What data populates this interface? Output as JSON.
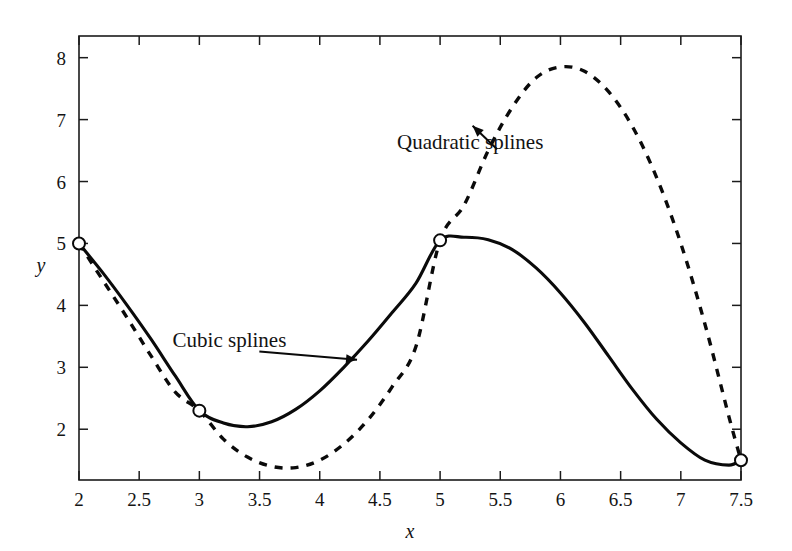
{
  "chart_data": {
    "type": "line",
    "title": "",
    "xlabel": "x",
    "ylabel": "y",
    "xlim": [
      2,
      7.5
    ],
    "ylim": [
      1.18,
      8.35
    ],
    "grid": false,
    "legend": "none",
    "x_ticks": [
      "2",
      "2.5",
      "3",
      "3.5",
      "4",
      "4.5",
      "5",
      "5.5",
      "6",
      "6.5",
      "7",
      "7.5"
    ],
    "x_tick_values": [
      2,
      2.5,
      3,
      3.5,
      4,
      4.5,
      5,
      5.5,
      6,
      6.5,
      7,
      7.5
    ],
    "y_ticks": [
      "8",
      "7",
      "6",
      "5",
      "4",
      "3",
      "2"
    ],
    "y_tick_values": [
      8,
      7,
      6,
      5,
      4,
      3,
      2
    ],
    "data_points": {
      "label": "interpolation knots",
      "marker": "open-circle",
      "x": [
        2,
        3,
        5,
        7.5
      ],
      "y": [
        5.0,
        2.3,
        5.05,
        1.5
      ]
    },
    "series": [
      {
        "name": "Cubic splines",
        "style": "solid",
        "color": "#0a0a0a",
        "x": [
          2.0,
          2.2,
          2.4,
          2.6,
          2.8,
          3.0,
          3.2,
          3.4,
          3.6,
          3.8,
          4.0,
          4.2,
          4.4,
          4.6,
          4.8,
          5.0,
          5.2,
          5.4,
          5.6,
          5.8,
          6.0,
          6.2,
          6.4,
          6.6,
          6.8,
          7.0,
          7.2,
          7.4,
          7.5
        ],
        "values": [
          5.0,
          4.52,
          4.0,
          3.45,
          2.86,
          2.3,
          2.1,
          2.04,
          2.12,
          2.32,
          2.62,
          3.0,
          3.42,
          3.88,
          4.36,
          5.05,
          5.1,
          5.06,
          4.9,
          4.6,
          4.2,
          3.72,
          3.18,
          2.64,
          2.16,
          1.78,
          1.5,
          1.42,
          1.5
        ]
      },
      {
        "name": "Quadratic splines",
        "style": "dashed",
        "color": "#0a0a0a",
        "x": [
          2.0,
          2.2,
          2.4,
          2.6,
          2.8,
          3.0,
          3.2,
          3.4,
          3.6,
          3.8,
          4.0,
          4.2,
          4.4,
          4.6,
          4.8,
          5.0,
          5.2,
          5.4,
          5.6,
          5.8,
          6.0,
          6.2,
          6.4,
          6.6,
          6.8,
          7.0,
          7.2,
          7.4,
          7.5
        ],
        "values": [
          5.0,
          4.4,
          3.8,
          3.18,
          2.6,
          2.3,
          1.84,
          1.55,
          1.4,
          1.38,
          1.5,
          1.76,
          2.15,
          2.68,
          3.34,
          5.05,
          5.62,
          6.5,
          7.2,
          7.68,
          7.85,
          7.78,
          7.45,
          6.88,
          6.06,
          5.0,
          3.7,
          2.2,
          1.5
        ]
      }
    ],
    "annotations": [
      {
        "text": "Cubic splines",
        "target_series": "Cubic splines",
        "text_x": 3.25,
        "text_y": 3.33,
        "arrow_tip_x": 4.31,
        "arrow_tip_y": 3.12
      },
      {
        "text": "Quadratic splines",
        "target_series": "Quadratic splines",
        "text_x": 5.25,
        "text_y": 6.52,
        "arrow_tip_x": 5.27,
        "arrow_tip_y": 6.9
      }
    ]
  }
}
